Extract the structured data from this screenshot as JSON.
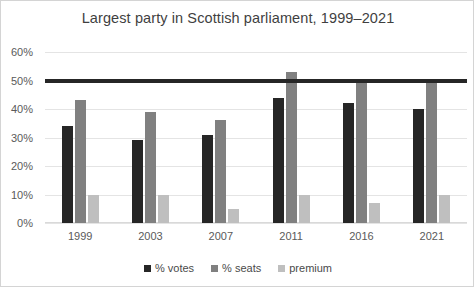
{
  "chart_data": {
    "type": "bar",
    "title": "Largest party in Scottish parliament, 1999–2021",
    "xlabel": "",
    "ylabel": "",
    "ylim": [
      0,
      60
    ],
    "ytick_labels": [
      "0%",
      "10%",
      "20%",
      "30%",
      "40%",
      "50%",
      "60%"
    ],
    "ytick_values": [
      0,
      10,
      20,
      30,
      40,
      50,
      60
    ],
    "grid": true,
    "legend_position": "bottom",
    "categories": [
      "1999",
      "2003",
      "2007",
      "2011",
      "2016",
      "2021"
    ],
    "series": [
      {
        "name": "% votes",
        "color": "#262626",
        "values": [
          34,
          29,
          31,
          44,
          42,
          40
        ]
      },
      {
        "name": "% seats",
        "color": "#808080",
        "values": [
          43,
          39,
          36,
          53,
          49,
          50
        ]
      },
      {
        "name": "premium",
        "color": "#bfbfbf",
        "values": [
          10,
          10,
          5,
          10,
          7,
          10
        ]
      }
    ],
    "annotations": [
      {
        "name": "majority-threshold-line",
        "type": "hline",
        "value": 50,
        "color": "#262626",
        "width_px": 4
      }
    ]
  },
  "legend": {
    "items": [
      {
        "label": "% votes",
        "color": "#262626"
      },
      {
        "label": "% seats",
        "color": "#808080"
      },
      {
        "label": "premium",
        "color": "#bfbfbf"
      }
    ]
  },
  "colors": {
    "votes": "#262626",
    "seats": "#808080",
    "premium": "#bfbfbf",
    "gridline": "#e4e4e4",
    "text": "#5a5a5a",
    "border": "#d4d4d4"
  }
}
